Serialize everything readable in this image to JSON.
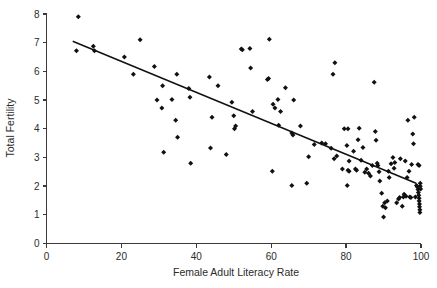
{
  "chart": {
    "type": "scatter",
    "title": "",
    "xlabel": "Female Adult Literacy Rate",
    "ylabel": "Total Fertility",
    "x_ticks": [
      "0",
      "20",
      "40",
      "60",
      "80",
      "100"
    ],
    "y_ticks": [
      "0",
      "1",
      "2",
      "3",
      "4",
      "5",
      "6",
      "7",
      "8"
    ],
    "marker_color": "#111111",
    "line_color": "#111111",
    "axis_color": "#3a3a3a"
  },
  "chart_data": {
    "type": "scatter",
    "title": "",
    "xlabel": "Female Adult Literacy Rate",
    "ylabel": "Total Fertility",
    "xlim": [
      0,
      100
    ],
    "ylim": [
      0,
      8
    ],
    "xticks": [
      0,
      20,
      40,
      60,
      80,
      100
    ],
    "yticks": [
      0,
      1,
      2,
      3,
      4,
      5,
      6,
      7,
      8
    ],
    "grid": false,
    "legend": "none",
    "marker": "diamond",
    "trendline": {
      "type": "linear-fit",
      "x_start": 7.0,
      "y_start": 7.05,
      "x_end": 98.7,
      "y_end": 2.1
    },
    "series": [
      {
        "name": "Countries",
        "points": [
          [
            8.5,
            7.9
          ],
          [
            8.0,
            6.72
          ],
          [
            12.5,
            6.88
          ],
          [
            12.8,
            6.72
          ],
          [
            20.8,
            6.5
          ],
          [
            23.2,
            5.9
          ],
          [
            25.0,
            7.1
          ],
          [
            28.8,
            6.17
          ],
          [
            29.5,
            5.0
          ],
          [
            30.8,
            4.72
          ],
          [
            31.0,
            5.5
          ],
          [
            31.3,
            3.18
          ],
          [
            33.5,
            5.02
          ],
          [
            34.5,
            4.3
          ],
          [
            34.8,
            5.9
          ],
          [
            35.0,
            3.7
          ],
          [
            38.0,
            5.4
          ],
          [
            38.3,
            5.1
          ],
          [
            38.5,
            2.8
          ],
          [
            43.5,
            5.8
          ],
          [
            43.8,
            3.33
          ],
          [
            44.2,
            4.4
          ],
          [
            45.8,
            5.5
          ],
          [
            48.0,
            3.1
          ],
          [
            49.5,
            4.92
          ],
          [
            50.0,
            4.45
          ],
          [
            50.2,
            4.0
          ],
          [
            50.5,
            4.1
          ],
          [
            52.0,
            6.78
          ],
          [
            52.3,
            6.75
          ],
          [
            54.3,
            6.8
          ],
          [
            54.5,
            6.12
          ],
          [
            55.0,
            4.6
          ],
          [
            59.0,
            5.72
          ],
          [
            59.3,
            5.75
          ],
          [
            59.5,
            7.12
          ],
          [
            60.5,
            4.85
          ],
          [
            61.0,
            4.72
          ],
          [
            61.8,
            5.02
          ],
          [
            62.0,
            4.12
          ],
          [
            62.5,
            4.6
          ],
          [
            63.8,
            5.43
          ],
          [
            65.5,
            3.85
          ],
          [
            65.8,
            3.78
          ],
          [
            65.5,
            2.02
          ],
          [
            66.0,
            5.0
          ],
          [
            67.8,
            4.1
          ],
          [
            69.5,
            2.1
          ],
          [
            70.0,
            3.02
          ],
          [
            60.3,
            2.52
          ],
          [
            74.5,
            3.48
          ],
          [
            76.0,
            3.32
          ],
          [
            76.5,
            5.9
          ],
          [
            77.0,
            6.3
          ],
          [
            76.8,
            2.95
          ],
          [
            79.5,
            4.0
          ],
          [
            80.5,
            4.0
          ],
          [
            80.2,
            3.42
          ],
          [
            80.8,
            2.88
          ],
          [
            80.5,
            2.55
          ],
          [
            80.8,
            2.52
          ],
          [
            80.3,
            2.02
          ],
          [
            82.0,
            3.22
          ],
          [
            82.5,
            2.6
          ],
          [
            82.8,
            2.55
          ],
          [
            83.5,
            4.02
          ],
          [
            83.2,
            3.62
          ],
          [
            84.0,
            2.9
          ],
          [
            84.5,
            3.35
          ],
          [
            85.5,
            2.6
          ],
          [
            86.0,
            2.45
          ],
          [
            86.5,
            2.35
          ],
          [
            87.5,
            5.62
          ],
          [
            87.8,
            3.9
          ],
          [
            88.0,
            3.6
          ],
          [
            88.3,
            2.8
          ],
          [
            88.5,
            2.72
          ],
          [
            88.8,
            2.5
          ],
          [
            89.0,
            2.18
          ],
          [
            89.5,
            1.75
          ],
          [
            89.8,
            1.3
          ],
          [
            90.0,
            0.92
          ],
          [
            90.3,
            1.42
          ],
          [
            90.5,
            1.25
          ],
          [
            91.0,
            1.48
          ],
          [
            91.3,
            2.52
          ],
          [
            91.5,
            2.3
          ],
          [
            92.0,
            2.78
          ],
          [
            92.5,
            3.0
          ],
          [
            93.0,
            2.82
          ],
          [
            93.5,
            1.42
          ],
          [
            94.0,
            1.55
          ],
          [
            94.3,
            1.6
          ],
          [
            94.5,
            2.95
          ],
          [
            95.0,
            1.3
          ],
          [
            95.3,
            1.62
          ],
          [
            95.5,
            1.72
          ],
          [
            96.0,
            1.65
          ],
          [
            96.3,
            2.3
          ],
          [
            96.5,
            4.3
          ],
          [
            96.8,
            2.52
          ],
          [
            97.0,
            1.62
          ],
          [
            97.3,
            1.6
          ],
          [
            97.5,
            2.75
          ],
          [
            97.8,
            3.82
          ],
          [
            98.0,
            3.48
          ],
          [
            98.2,
            4.4
          ],
          [
            98.5,
            1.62
          ],
          [
            98.8,
            2.02
          ],
          [
            99.0,
            1.98
          ],
          [
            99.2,
            1.88
          ],
          [
            99.3,
            1.78
          ],
          [
            99.4,
            1.68
          ],
          [
            99.5,
            1.58
          ],
          [
            99.5,
            1.48
          ],
          [
            99.6,
            1.38
          ],
          [
            99.6,
            1.28
          ],
          [
            99.7,
            1.18
          ],
          [
            99.7,
            1.08
          ],
          [
            99.8,
            2.1
          ],
          [
            99.8,
            2.0
          ],
          [
            99.9,
            1.9
          ],
          [
            99.5,
            2.72
          ],
          [
            99.2,
            2.75
          ],
          [
            92.8,
            2.62
          ],
          [
            95.8,
            2.88
          ],
          [
            85.0,
            2.48
          ],
          [
            87.0,
            2.72
          ],
          [
            77.5,
            3.05
          ],
          [
            79.0,
            2.6
          ],
          [
            71.5,
            3.45
          ],
          [
            73.5,
            3.5
          ]
        ]
      }
    ]
  }
}
